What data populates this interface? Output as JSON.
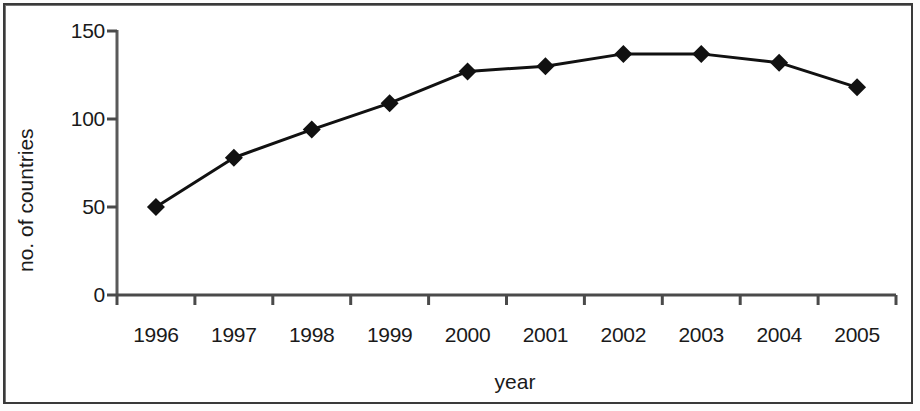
{
  "chart_data": {
    "type": "line",
    "title": "",
    "xlabel": "year",
    "ylabel": "no. of countries",
    "categories": [
      "1996",
      "1997",
      "1998",
      "1999",
      "2000",
      "2001",
      "2002",
      "2003",
      "2004",
      "2005"
    ],
    "values": [
      50,
      78,
      94,
      109,
      127,
      130,
      137,
      137,
      132,
      118
    ],
    "series": [
      {
        "name": "no. of countries",
        "values": [
          50,
          78,
          94,
          109,
          127,
          130,
          137,
          137,
          132,
          118
        ]
      }
    ],
    "ylim": [
      0,
      150
    ],
    "y_ticks": [
      0,
      50,
      100,
      150
    ],
    "y_tick_labels": [
      "0",
      "50",
      "100",
      "150"
    ],
    "grid": false,
    "legend": false,
    "legend_position": "none",
    "marker": "diamond",
    "line_color": "#111111",
    "marker_color": "#111111",
    "axis_color": "#4a4a4a",
    "background_color": "#ffffff"
  },
  "axes": {
    "y_title": "no. of countries",
    "x_title": "year"
  }
}
